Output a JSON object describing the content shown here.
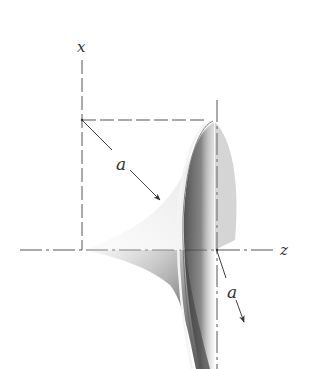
{
  "diagram": {
    "type": "3d-surface-sketch",
    "axes": {
      "x": {
        "label": "x"
      },
      "z": {
        "label": "z"
      }
    },
    "annotations": [
      {
        "label": "a",
        "note": "radius arrow from axis point toward surface"
      },
      {
        "label": "a",
        "note": "arrow from origin of rim along surface"
      }
    ],
    "colors": {
      "background": "#ffffff",
      "line": "#444444",
      "shade_dark": "#3a3a3a",
      "shade_light": "#d8d8d8"
    }
  }
}
